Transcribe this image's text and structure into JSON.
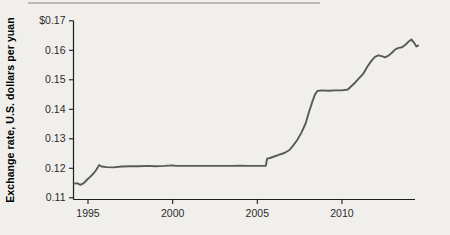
{
  "figure": {
    "background_color": "#f1efec",
    "top_rule_color": "#a9a7a5",
    "axis_color": "#1d1d1d",
    "tick_label_color": "#2b2b2b",
    "line_color": "#59595b"
  },
  "chart_data": {
    "type": "line",
    "title": "",
    "xlabel": "",
    "ylabel": "Exchange rate, U.S. dollars per yuan",
    "xlim": [
      1994.1,
      2014.6
    ],
    "ylim": [
      0.11,
      0.17
    ],
    "grid": false,
    "legend": "none",
    "x_ticks": [
      {
        "value": 1995,
        "label": "1995"
      },
      {
        "value": 2000,
        "label": "2000"
      },
      {
        "value": 2005,
        "label": "2005"
      },
      {
        "value": 2010,
        "label": "2010"
      }
    ],
    "y_ticks": [
      {
        "value": 0.11,
        "label": "0.11"
      },
      {
        "value": 0.12,
        "label": "0.12"
      },
      {
        "value": 0.13,
        "label": "0.13"
      },
      {
        "value": 0.14,
        "label": "0.14"
      },
      {
        "value": 0.15,
        "label": "0.15"
      },
      {
        "value": 0.16,
        "label": "0.16"
      },
      {
        "value": 0.17,
        "label": "$0.17"
      }
    ],
    "series": [
      {
        "name": "U.S. dollars per yuan",
        "points": [
          [
            1994.15,
            0.1147
          ],
          [
            1994.35,
            0.115
          ],
          [
            1994.55,
            0.1144
          ],
          [
            1994.75,
            0.115
          ],
          [
            1994.95,
            0.1162
          ],
          [
            1995.15,
            0.1172
          ],
          [
            1995.35,
            0.1184
          ],
          [
            1995.5,
            0.1196
          ],
          [
            1995.65,
            0.1211
          ],
          [
            1995.8,
            0.1206
          ],
          [
            1996.1,
            0.1204
          ],
          [
            1996.5,
            0.1203
          ],
          [
            1997.0,
            0.1206
          ],
          [
            1997.5,
            0.1207
          ],
          [
            1998.0,
            0.1207
          ],
          [
            1998.5,
            0.1208
          ],
          [
            1999.0,
            0.1207
          ],
          [
            1999.5,
            0.1208
          ],
          [
            2000.0,
            0.121
          ],
          [
            2000.2,
            0.1208
          ],
          [
            2000.6,
            0.1208
          ],
          [
            2001.0,
            0.1208
          ],
          [
            2001.5,
            0.1208
          ],
          [
            2002.0,
            0.1208
          ],
          [
            2002.5,
            0.1208
          ],
          [
            2003.0,
            0.1208
          ],
          [
            2003.5,
            0.1208
          ],
          [
            2004.0,
            0.1209
          ],
          [
            2004.5,
            0.1208
          ],
          [
            2005.0,
            0.1208
          ],
          [
            2005.5,
            0.1208
          ],
          [
            2005.58,
            0.1233
          ],
          [
            2005.75,
            0.1235
          ],
          [
            2006.0,
            0.124
          ],
          [
            2006.3,
            0.1246
          ],
          [
            2006.6,
            0.1252
          ],
          [
            2006.9,
            0.1262
          ],
          [
            2007.1,
            0.1276
          ],
          [
            2007.35,
            0.1295
          ],
          [
            2007.6,
            0.132
          ],
          [
            2007.85,
            0.1352
          ],
          [
            2008.05,
            0.139
          ],
          [
            2008.25,
            0.1425
          ],
          [
            2008.4,
            0.145
          ],
          [
            2008.55,
            0.1462
          ],
          [
            2008.8,
            0.1464
          ],
          [
            2009.2,
            0.1463
          ],
          [
            2009.6,
            0.1464
          ],
          [
            2010.0,
            0.1464
          ],
          [
            2010.35,
            0.1467
          ],
          [
            2010.55,
            0.1478
          ],
          [
            2010.8,
            0.1492
          ],
          [
            2011.0,
            0.1505
          ],
          [
            2011.25,
            0.152
          ],
          [
            2011.5,
            0.1544
          ],
          [
            2011.75,
            0.1565
          ],
          [
            2011.95,
            0.1578
          ],
          [
            2012.15,
            0.1583
          ],
          [
            2012.35,
            0.158
          ],
          [
            2012.55,
            0.1576
          ],
          [
            2012.75,
            0.1582
          ],
          [
            2012.95,
            0.1592
          ],
          [
            2013.15,
            0.1603
          ],
          [
            2013.35,
            0.1608
          ],
          [
            2013.55,
            0.161
          ],
          [
            2013.75,
            0.1619
          ],
          [
            2013.95,
            0.163
          ],
          [
            2014.1,
            0.1637
          ],
          [
            2014.25,
            0.1626
          ],
          [
            2014.4,
            0.1613
          ],
          [
            2014.5,
            0.1616
          ]
        ]
      }
    ]
  }
}
